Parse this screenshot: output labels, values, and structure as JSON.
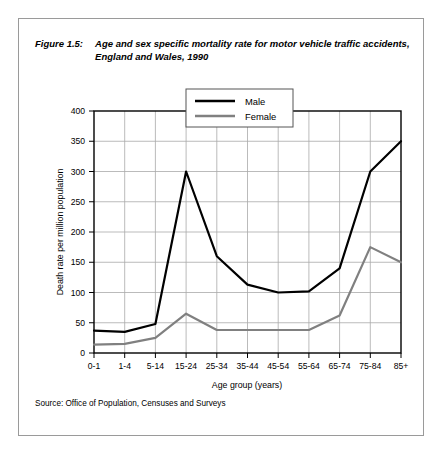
{
  "figure": {
    "label": "Figure 1.5:",
    "title": "Age and sex specific mortality rate for motor vehicle traffic accidents, England and Wales, 1990",
    "source": "Source: Office of Population, Censuses and Surveys"
  },
  "colors": {
    "male_line": "#000000",
    "female_line": "#808080",
    "grid": "#a9a9a9",
    "axis": "#000000",
    "frame": "#9a9a9a",
    "background": "#ffffff"
  },
  "legend": {
    "position": "inside-top-center",
    "entries": [
      {
        "name": "Male",
        "color": "#000000"
      },
      {
        "name": "Female",
        "color": "#808080"
      }
    ]
  },
  "chart_data": {
    "type": "line",
    "title": "Age and sex specific mortality rate for motor vehicle traffic accidents, England and Wales, 1990",
    "xlabel": "Age group (years)",
    "ylabel": "Death rate per million population",
    "categories": [
      "0-1",
      "1-4",
      "5-14",
      "15-24",
      "25-34",
      "35-44",
      "45-54",
      "55-64",
      "65-74",
      "75-84",
      "85+"
    ],
    "yticks": [
      0,
      50,
      100,
      150,
      200,
      250,
      300,
      350,
      400
    ],
    "ylim": [
      0,
      400
    ],
    "grid": true,
    "series": [
      {
        "name": "Male",
        "color": "#000000",
        "values": [
          37,
          35,
          48,
          300,
          160,
          113,
          100,
          102,
          140,
          300,
          350
        ]
      },
      {
        "name": "Female",
        "color": "#808080",
        "values": [
          14,
          15,
          25,
          65,
          38,
          38,
          38,
          38,
          62,
          175,
          150
        ]
      }
    ]
  }
}
